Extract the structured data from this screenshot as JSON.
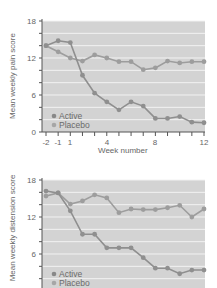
{
  "colors": {
    "plot_bg": "#d3d3d3",
    "grid": "#f2f2f2",
    "axis": "#555555",
    "active": "#8f8f8f",
    "placebo": "#9d9d9d",
    "active_legend": "#888888",
    "placebo_legend": "#a6a6a6"
  },
  "chart_data": [
    {
      "type": "line",
      "title": "",
      "xlabel": "Week number",
      "ylabel": "Mean weekly pain score",
      "x": [
        -2,
        -1,
        1,
        2,
        3,
        4,
        5,
        6,
        7,
        8,
        9,
        10,
        11,
        12
      ],
      "x_tick_labels": [
        "-2",
        "-1",
        "1",
        "",
        "",
        "4",
        "",
        "",
        "",
        "8",
        "",
        "",
        "",
        "12"
      ],
      "y_ticks": [
        0,
        6,
        12,
        18
      ],
      "ylim": [
        0,
        18
      ],
      "grid": true,
      "legend_position": "lower-left",
      "series": [
        {
          "name": "Active",
          "values": [
            14,
            14.8,
            14.5,
            9.2,
            6.3,
            4.9,
            3.6,
            4.9,
            4.2,
            2.2,
            2.2,
            2.5,
            1.6,
            1.5
          ]
        },
        {
          "name": "Placebo",
          "values": [
            14,
            13,
            12,
            11.5,
            12.5,
            12,
            11.4,
            11.4,
            10.1,
            10.4,
            11.5,
            11.2,
            11.4,
            11.4
          ]
        }
      ]
    },
    {
      "type": "line",
      "title": "",
      "xlabel": "",
      "ylabel": "Mean weekly distension score",
      "x": [
        -2,
        -1,
        1,
        2,
        3,
        4,
        5,
        6,
        7,
        8,
        9,
        10,
        11,
        12
      ],
      "y_ticks": [
        6,
        12,
        18
      ],
      "ylim": [
        0,
        18
      ],
      "grid": true,
      "legend_position": "lower-left",
      "series": [
        {
          "name": "Active",
          "values": [
            16.2,
            15.9,
            13,
            9.2,
            9.2,
            7.0,
            7.0,
            7.0,
            5.4,
            3.7,
            3.7,
            2.8,
            3.4,
            3.4
          ]
        },
        {
          "name": "Placebo",
          "values": [
            15.4,
            15.9,
            14.1,
            14.6,
            15.6,
            15.1,
            12.7,
            13.3,
            13.2,
            13.2,
            13.5,
            13.9,
            12.0,
            13.3
          ]
        }
      ]
    }
  ],
  "top": {
    "ylabel": "Mean weekly pain score",
    "xlabel": "Week number",
    "legend": {
      "active": "Active",
      "placebo": "Placebo"
    },
    "yticks": {
      "t0": "0",
      "t6": "6",
      "t12": "12",
      "t18": "18"
    },
    "xticks": {
      "m2": "-2",
      "m1": "-1",
      "p1": "1",
      "p4": "4",
      "p8": "8",
      "p12": "12"
    }
  },
  "bottom": {
    "ylabel": "Mean weekly distension score",
    "legend": {
      "active": "Active",
      "placebo": "Placebo"
    },
    "yticks": {
      "t6": "6",
      "t12": "12",
      "t18": "18"
    }
  }
}
